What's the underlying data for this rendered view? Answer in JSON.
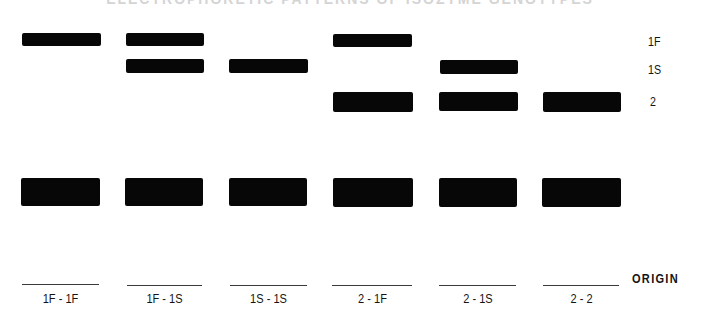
{
  "figure": {
    "title_fragment": "ELECTROPHORETIC PATTERNS OF ISOZYME GENOTYPES",
    "row_labels": {
      "fast": "1F",
      "slow": "1S",
      "two": "2"
    },
    "origin_label": "ORIGIN",
    "lanes": [
      {
        "label": "1F - 1F",
        "bands": [
          "1F",
          "origin"
        ]
      },
      {
        "label": "1F - 1S",
        "bands": [
          "1F",
          "1S",
          "origin"
        ]
      },
      {
        "label": "1S - 1S",
        "bands": [
          "1S",
          "origin"
        ]
      },
      {
        "label": "2 - 1F",
        "bands": [
          "1F",
          "2",
          "origin"
        ]
      },
      {
        "label": "2 - 1S",
        "bands": [
          "1S",
          "2",
          "origin"
        ]
      },
      {
        "label": "2 - 2",
        "bands": [
          "2",
          "origin"
        ]
      }
    ],
    "colors": {
      "band": "#070707",
      "background": "#ffffff",
      "text": "#141414"
    }
  }
}
